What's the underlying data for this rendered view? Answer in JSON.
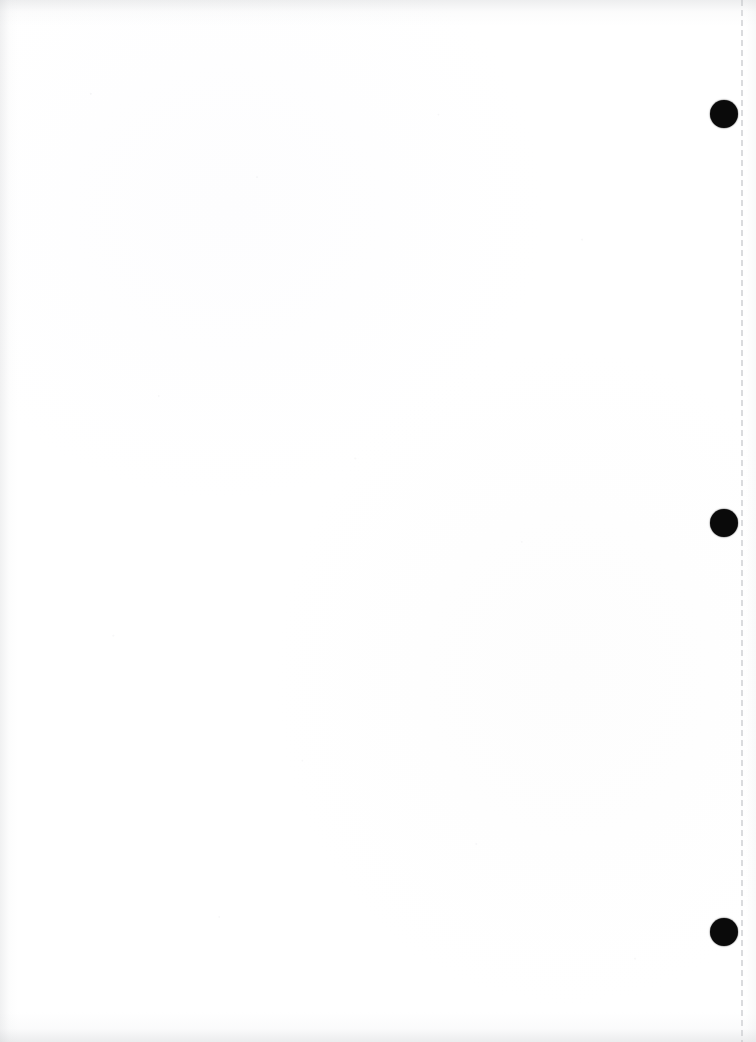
{
  "document": {
    "kind": "scanned-blank-page",
    "orientation": "portrait",
    "page_width_px": 756,
    "page_height_px": 1042,
    "body_text": "",
    "has_readable_text": false,
    "paper_color": "#ffffff"
  },
  "marks": {
    "registration_dots": [
      {
        "name": "registration-dot-top",
        "x": 724,
        "y": 114,
        "diameter": 28,
        "color": "#0a0a0a"
      },
      {
        "name": "registration-dot-middle",
        "x": 724,
        "y": 523,
        "diameter": 28,
        "color": "#0a0a0a"
      },
      {
        "name": "registration-dot-bottom",
        "x": 724,
        "y": 932,
        "diameter": 28,
        "color": "#0a0a0a"
      }
    ],
    "perforation_line": {
      "name": "perforation-line",
      "x": 742,
      "orientation": "vertical",
      "style": "dashed",
      "dash_length": 6,
      "dash_gap": 4,
      "color": "#c4c6ca"
    }
  },
  "artifacts": {
    "scan_shadows": [
      {
        "edge": "top",
        "color": "#c4c6c9"
      },
      {
        "edge": "left",
        "color": "#c6c8cb"
      },
      {
        "edge": "bottom",
        "color": "#c2c4c8"
      },
      {
        "edge": "right",
        "color": "#d6d8db"
      }
    ],
    "ghost_text": [
      {
        "name": "ghost-text-upper",
        "x": 30,
        "y": 44,
        "text": "",
        "legible": false
      },
      {
        "name": "ghost-text-lower",
        "x": 70,
        "y": 908,
        "text": "",
        "legible": false
      }
    ]
  }
}
